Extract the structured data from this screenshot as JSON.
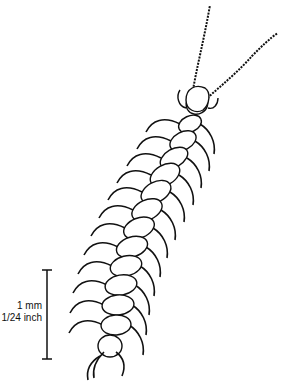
{
  "figure": {
    "ink_color": "#111111",
    "background": "#ffffff"
  },
  "scale_bar": {
    "metric_label": "1 mm",
    "imperial_label": "1/24 inch"
  },
  "body": {
    "segments": [
      {
        "x": 197,
        "y": 104,
        "rx": 11,
        "ry": 10,
        "angle": -30
      },
      {
        "x": 190,
        "y": 124,
        "rx": 12,
        "ry": 8,
        "angle": -25
      },
      {
        "x": 183,
        "y": 141,
        "rx": 14,
        "ry": 9,
        "angle": -28
      },
      {
        "x": 174,
        "y": 158,
        "rx": 15,
        "ry": 9,
        "angle": -30
      },
      {
        "x": 165,
        "y": 175,
        "rx": 16,
        "ry": 10,
        "angle": -30
      },
      {
        "x": 156,
        "y": 192,
        "rx": 16,
        "ry": 10,
        "angle": -28
      },
      {
        "x": 147,
        "y": 210,
        "rx": 16,
        "ry": 10,
        "angle": -25
      },
      {
        "x": 139,
        "y": 228,
        "rx": 16,
        "ry": 10,
        "angle": -22
      },
      {
        "x": 132,
        "y": 247,
        "rx": 16,
        "ry": 10,
        "angle": -18
      },
      {
        "x": 126,
        "y": 266,
        "rx": 16,
        "ry": 10,
        "angle": -14
      },
      {
        "x": 121,
        "y": 285,
        "rx": 16,
        "ry": 10,
        "angle": -10
      },
      {
        "x": 118,
        "y": 305,
        "rx": 16,
        "ry": 10,
        "angle": -6
      },
      {
        "x": 116,
        "y": 325,
        "rx": 15,
        "ry": 10,
        "angle": -4
      },
      {
        "x": 110,
        "y": 346,
        "rx": 12,
        "ry": 11,
        "angle": 0
      }
    ]
  }
}
